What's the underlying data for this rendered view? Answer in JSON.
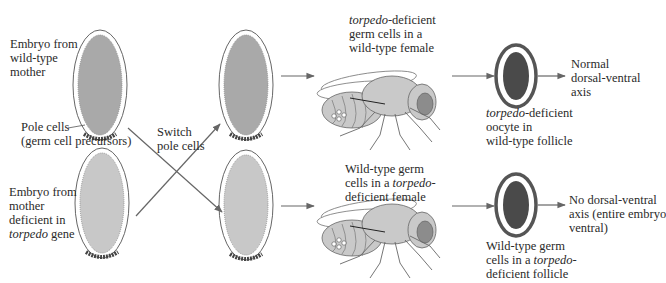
{
  "colors": {
    "embryo_top_fill": "#a9a9a9",
    "embryo_bottom_fill": "#c8c8c8",
    "oocyte_fill": "#4a4a4a",
    "outline": "#555555",
    "arrow": "#666666",
    "fly_fill": "#c9c9c9",
    "fly_eye": "#8c8c8c"
  },
  "left": {
    "top_label": [
      "Embryo from",
      "wild-type",
      "mother"
    ],
    "pole_label": [
      "Pole cells",
      "(germ cell precursors)"
    ],
    "bottom_label": [
      "Embryo from",
      "mother",
      "deficient in"
    ],
    "bottom_label_last_italic": "torpedo",
    "bottom_label_last_rest": " gene"
  },
  "switch_label": [
    "Switch",
    "pole cells"
  ],
  "top_row": {
    "fly_label_italic": "torpedo",
    "fly_label_line1_rest": "-deficient",
    "fly_label_line2": "germ cells in a",
    "fly_label_line3": "wild-type female",
    "follicle_label_italic": "torpedo",
    "follicle_label_line1_rest": "-deficient",
    "follicle_label_line2": "oocyte in",
    "follicle_label_line3": "wild-type follicle",
    "result": [
      "Normal",
      "dorsal-ventral",
      "axis"
    ]
  },
  "bottom_row": {
    "fly_label_line1": "Wild-type germ",
    "fly_label_line2_pre": "cells in a ",
    "fly_label_line2_italic": "torpedo",
    "fly_label_line2_post": "-",
    "fly_label_line3": "deficient female",
    "follicle_label_line1": "Wild-type germ",
    "follicle_label_line2_pre": "cells in a ",
    "follicle_label_line2_italic": "torpedo",
    "follicle_label_line2_post": "-",
    "follicle_label_line3": "deficient follicle",
    "result": [
      "No dorsal-ventral",
      "axis (entire embryo",
      "ventral)"
    ]
  }
}
